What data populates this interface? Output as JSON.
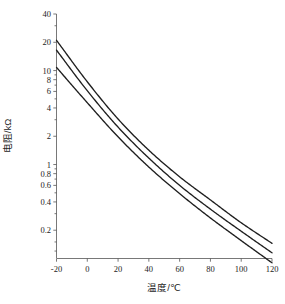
{
  "chart_data": {
    "type": "line",
    "title": "",
    "xlabel": "温度/℃",
    "ylabel": "电阻/kΩ",
    "yscale": "log",
    "xscale": "linear",
    "xlim": [
      -20,
      120
    ],
    "ylim": [
      0.1,
      40
    ],
    "grid": false,
    "legend": "none",
    "xticks": [
      -20,
      0,
      20,
      40,
      60,
      80,
      100,
      120
    ],
    "xtick_labels": [
      "-20",
      "0",
      "20",
      "40",
      "60",
      "80",
      "100",
      "120"
    ],
    "yticks": [
      40,
      20,
      10,
      8,
      6,
      4,
      2,
      1,
      0.8,
      0.6,
      0.4,
      0.2
    ],
    "ytick_labels": [
      "40",
      "20",
      "10",
      "8",
      "6",
      "4",
      "2",
      "1",
      "0.8",
      "0.6",
      "0.4",
      "0.2"
    ],
    "x": [
      -20,
      0,
      20,
      40,
      60,
      80,
      100,
      120
    ],
    "series": [
      {
        "name": "upper-tolerance-curve",
        "values": [
          21.0,
          7.6,
          3.05,
          1.42,
          0.74,
          0.42,
          0.24,
          0.145
        ],
        "color": "#1f1f1f"
      },
      {
        "name": "nominal-curve",
        "values": [
          16.5,
          6.1,
          2.5,
          1.17,
          0.6,
          0.335,
          0.195,
          0.115
        ],
        "color": "#1f1f1f"
      },
      {
        "name": "lower-tolerance-curve",
        "values": [
          10.8,
          4.55,
          1.97,
          0.94,
          0.49,
          0.27,
          0.155,
          0.09
        ],
        "color": "#1f1f1f"
      }
    ]
  },
  "axis": {
    "x_title": "温度/℃",
    "y_title": "电阻/kΩ"
  },
  "colors": {
    "curve": "#1f1f1f",
    "axis": "#555555",
    "text": "#1c1c1c",
    "background": "#ffffff"
  }
}
